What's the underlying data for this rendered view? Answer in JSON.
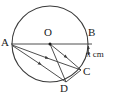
{
  "figure": {
    "type": "circle-geometry-diagram",
    "stroke_color": "#3a3a3a",
    "label_color": "#1a1a1a",
    "background_color": "#ffffff",
    "circle": {
      "center_label": "O",
      "cx": 50,
      "cy": 44,
      "r": 38
    },
    "points": [
      {
        "id": "A",
        "label": "A",
        "x": 12,
        "y": 44,
        "on": "circle"
      },
      {
        "id": "O",
        "label": "O",
        "x": 50,
        "y": 44,
        "on": "centre"
      },
      {
        "id": "B",
        "label": "B",
        "x": 88,
        "y": 44,
        "on": "circle"
      },
      {
        "id": "C",
        "label": "C",
        "x": 81,
        "y": 70,
        "on": "circle"
      },
      {
        "id": "D",
        "label": "D",
        "x": 66,
        "y": 82,
        "on": "circle"
      }
    ],
    "segments": [
      {
        "id": "AB",
        "from": "A",
        "to": "B",
        "kind": "diameter",
        "arrow": false
      },
      {
        "id": "AC",
        "from": "A",
        "to": "C",
        "kind": "chord",
        "arrow": true
      },
      {
        "id": "AD",
        "from": "A",
        "to": "D",
        "kind": "chord",
        "arrow": true
      },
      {
        "id": "OC",
        "from": "O",
        "to": "C",
        "kind": "radius",
        "arrow": true
      },
      {
        "id": "OD",
        "from": "O",
        "to": "D",
        "kind": "radius",
        "arrow": true
      },
      {
        "id": "CD",
        "from": "C",
        "to": "D",
        "kind": "chord",
        "arrow": false
      }
    ],
    "measurement": {
      "label": "π cm",
      "applies_to": "arc BC",
      "marker": "double-headed-vertical-arrow"
    }
  }
}
